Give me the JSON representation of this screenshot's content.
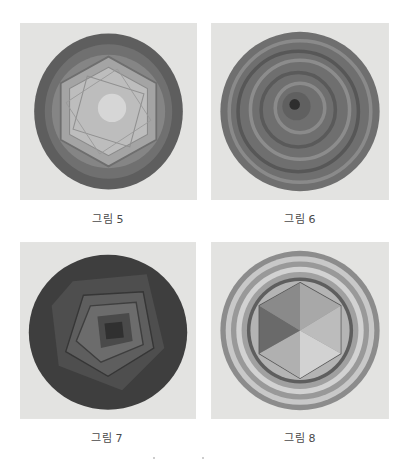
{
  "figures": [
    {
      "caption": "그림 5",
      "description": "pencil drawing: dark ring around a light hexagon with overlapping polygons"
    },
    {
      "caption": "그림 6",
      "description": "pencil drawing: concentric swirling rings with dark center"
    },
    {
      "caption": "그림 7",
      "description": "pencil drawing: dark circle with nested rotated squares"
    },
    {
      "caption": "그림 8",
      "description": "pencil drawing: wavy rings around a shaded hexagon divided into six triangles"
    }
  ]
}
